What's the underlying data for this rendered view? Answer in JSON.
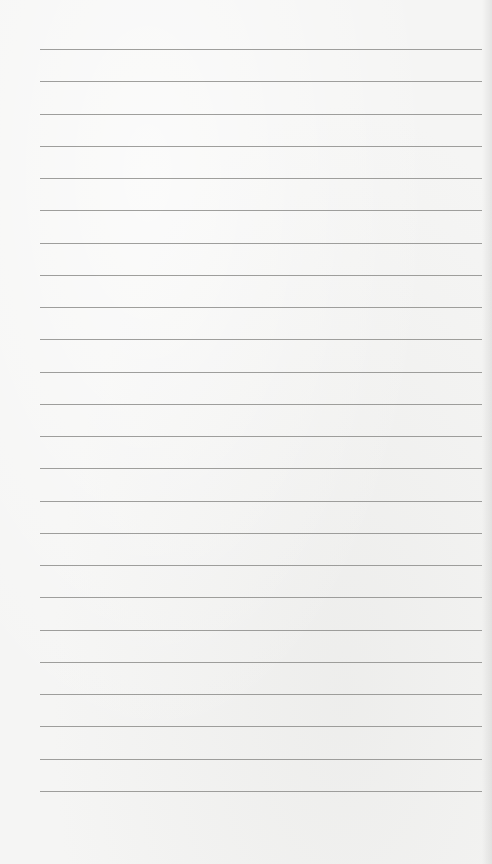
{
  "page": {
    "type": "lined-paper",
    "background_color": "#f5f5f4",
    "line_color": "#8e8e8c",
    "line_count": 24,
    "first_line_y": 49,
    "line_spacing": 32.26,
    "line_left": 40,
    "line_width": 442
  }
}
